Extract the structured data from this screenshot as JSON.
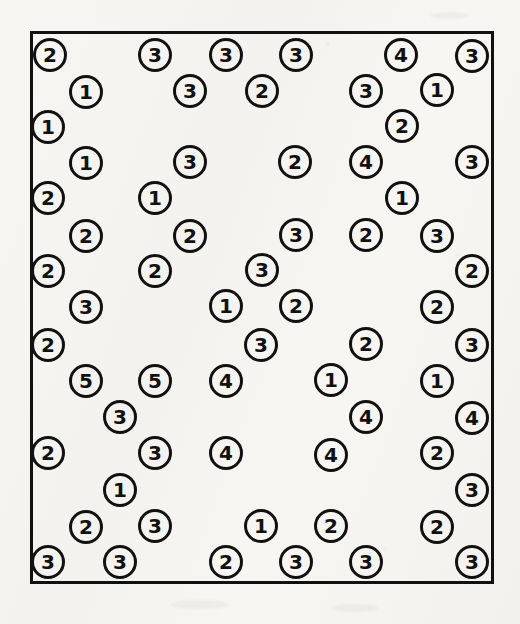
{
  "page": {
    "background_color": "#f6f5f2",
    "width": 520,
    "height": 624
  },
  "frame": {
    "name": "bounding-box",
    "x": 30,
    "y": 31,
    "width": 464,
    "height": 553,
    "stroke_color": "#111111",
    "stroke_width": 3
  },
  "token_style": {
    "diameter": 34,
    "stroke_color": "#111111",
    "text_color": "#111111",
    "font_size": 20
  },
  "chart_data": {
    "type": "scatter",
    "title": "",
    "subtitle": "",
    "xlabel": "",
    "ylabel": "",
    "xlim": [
      30,
      494
    ],
    "ylim": [
      31,
      584
    ],
    "grid": false,
    "legend": "none",
    "annotation": "Scattered numbered circle tokens inside a rectangular border",
    "value_counts": {
      "1": 13,
      "2": 23,
      "3": 27,
      "4": 8,
      "5": 2
    },
    "total_points": 73,
    "points": [
      {
        "label": "2",
        "x": 50,
        "y": 55
      },
      {
        "label": "3",
        "x": 155,
        "y": 55
      },
      {
        "label": "3",
        "x": 226,
        "y": 55
      },
      {
        "label": "3",
        "x": 296,
        "y": 55
      },
      {
        "label": "4",
        "x": 401,
        "y": 55
      },
      {
        "label": "3",
        "x": 472,
        "y": 56
      },
      {
        "label": "1",
        "x": 86,
        "y": 92
      },
      {
        "label": "3",
        "x": 190,
        "y": 91
      },
      {
        "label": "2",
        "x": 262,
        "y": 91
      },
      {
        "label": "3",
        "x": 366,
        "y": 91
      },
      {
        "label": "1",
        "x": 437,
        "y": 90
      },
      {
        "label": "1",
        "x": 48,
        "y": 127
      },
      {
        "label": "2",
        "x": 402,
        "y": 126
      },
      {
        "label": "1",
        "x": 86,
        "y": 163
      },
      {
        "label": "3",
        "x": 190,
        "y": 162
      },
      {
        "label": "2",
        "x": 295,
        "y": 162
      },
      {
        "label": "4",
        "x": 366,
        "y": 162
      },
      {
        "label": "3",
        "x": 472,
        "y": 162
      },
      {
        "label": "2",
        "x": 48,
        "y": 198
      },
      {
        "label": "1",
        "x": 155,
        "y": 198
      },
      {
        "label": "1",
        "x": 402,
        "y": 198
      },
      {
        "label": "2",
        "x": 86,
        "y": 236
      },
      {
        "label": "2",
        "x": 190,
        "y": 236
      },
      {
        "label": "3",
        "x": 296,
        "y": 235
      },
      {
        "label": "2",
        "x": 366,
        "y": 235
      },
      {
        "label": "3",
        "x": 437,
        "y": 236
      },
      {
        "label": "2",
        "x": 48,
        "y": 271
      },
      {
        "label": "2",
        "x": 155,
        "y": 271
      },
      {
        "label": "3",
        "x": 262,
        "y": 270
      },
      {
        "label": "2",
        "x": 472,
        "y": 271
      },
      {
        "label": "3",
        "x": 86,
        "y": 307
      },
      {
        "label": "1",
        "x": 226,
        "y": 306
      },
      {
        "label": "2",
        "x": 296,
        "y": 306
      },
      {
        "label": "2",
        "x": 437,
        "y": 307
      },
      {
        "label": "2",
        "x": 48,
        "y": 345
      },
      {
        "label": "3",
        "x": 261,
        "y": 345
      },
      {
        "label": "2",
        "x": 366,
        "y": 344
      },
      {
        "label": "3",
        "x": 472,
        "y": 345
      },
      {
        "label": "5",
        "x": 86,
        "y": 381
      },
      {
        "label": "5",
        "x": 155,
        "y": 381
      },
      {
        "label": "4",
        "x": 226,
        "y": 381
      },
      {
        "label": "1",
        "x": 331,
        "y": 380
      },
      {
        "label": "1",
        "x": 437,
        "y": 381
      },
      {
        "label": "3",
        "x": 120,
        "y": 417
      },
      {
        "label": "4",
        "x": 366,
        "y": 417
      },
      {
        "label": "4",
        "x": 472,
        "y": 418
      },
      {
        "label": "2",
        "x": 48,
        "y": 453
      },
      {
        "label": "3",
        "x": 155,
        "y": 453
      },
      {
        "label": "4",
        "x": 226,
        "y": 453
      },
      {
        "label": "4",
        "x": 331,
        "y": 455
      },
      {
        "label": "2",
        "x": 437,
        "y": 453
      },
      {
        "label": "1",
        "x": 120,
        "y": 490
      },
      {
        "label": "3",
        "x": 472,
        "y": 490
      },
      {
        "label": "2",
        "x": 86,
        "y": 527
      },
      {
        "label": "3",
        "x": 155,
        "y": 526
      },
      {
        "label": "1",
        "x": 261,
        "y": 526
      },
      {
        "label": "2",
        "x": 331,
        "y": 526
      },
      {
        "label": "2",
        "x": 437,
        "y": 527
      },
      {
        "label": "3",
        "x": 48,
        "y": 562
      },
      {
        "label": "3",
        "x": 120,
        "y": 562
      },
      {
        "label": "2",
        "x": 226,
        "y": 562
      },
      {
        "label": "3",
        "x": 296,
        "y": 562
      },
      {
        "label": "3",
        "x": 366,
        "y": 562
      },
      {
        "label": "3",
        "x": 472,
        "y": 562
      }
    ]
  }
}
